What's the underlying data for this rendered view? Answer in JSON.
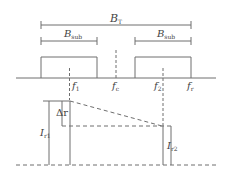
{
  "diagram": {
    "type": "frequency-band / signal-level schematic",
    "colors": {
      "line": "#6e6e6e",
      "text": "#444444",
      "background": "#ffffff"
    },
    "labels": {
      "bt": {
        "main": "B",
        "sub": "T"
      },
      "bsub_left": {
        "main": "B",
        "sub": "sub"
      },
      "bsub_right": {
        "main": "B",
        "sub": "sub"
      },
      "f1": {
        "main": "f",
        "sub": "1"
      },
      "fc": {
        "main": "f",
        "sub": "c"
      },
      "f2": {
        "main": "f",
        "sub": "2"
      },
      "fr": {
        "main": "f",
        "sub": "r"
      },
      "delta_r": {
        "main": "Δr",
        "sub": ""
      },
      "ir1": {
        "main": "I",
        "sub": "r1"
      },
      "ir2": {
        "main": "I",
        "sub": "r2"
      }
    }
  }
}
